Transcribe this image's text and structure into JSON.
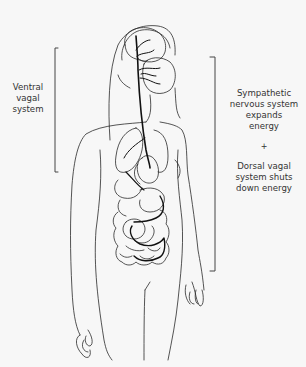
{
  "diagram": {
    "colors": {
      "background": "#f7f7f7",
      "outline": "#2a2a2a",
      "nerve": "#111111",
      "text": "#333333"
    },
    "left_label": {
      "lines": [
        "Ventral",
        "vagal",
        "system"
      ]
    },
    "right_label": {
      "block1": [
        "Sympathetic",
        "nervous system",
        "expands",
        "energy"
      ],
      "separator": "+",
      "block2": [
        "Dorsal vagal",
        "system shuts",
        "down energy"
      ]
    }
  }
}
